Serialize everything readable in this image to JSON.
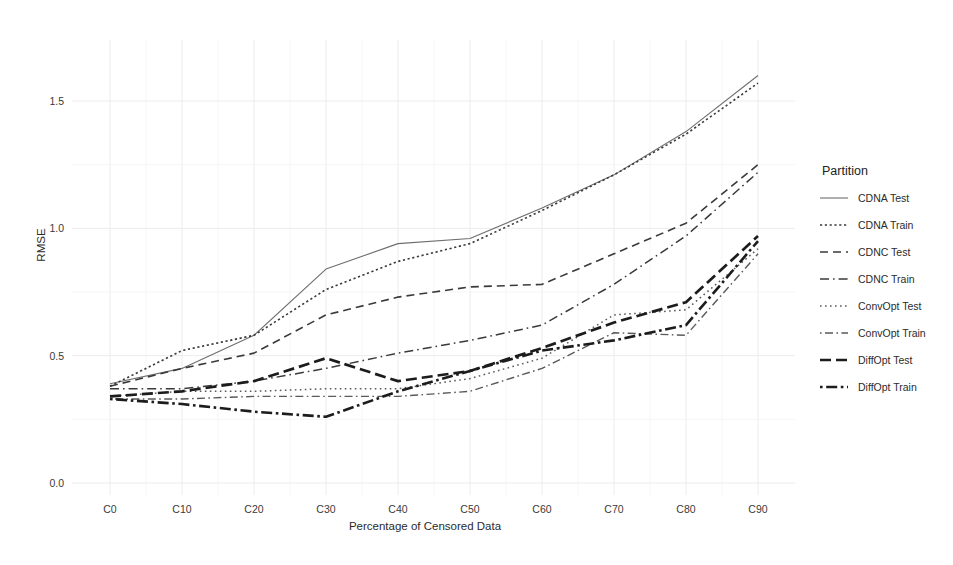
{
  "chart_data": {
    "type": "line",
    "title": "",
    "xlabel": "Percentage of Censored Data",
    "ylabel": "RMSE",
    "categories": [
      "C0",
      "C10",
      "C20",
      "C30",
      "C40",
      "C50",
      "C60",
      "C70",
      "C80",
      "C90"
    ],
    "x_tick_labels": [
      "C0",
      "C10",
      "C20",
      "C30",
      "C40",
      "C50",
      "C60",
      "C70",
      "C80",
      "C90"
    ],
    "y_tick_labels": [
      "0.0",
      "0.5",
      "1.0",
      "1.5"
    ],
    "y_ticks": [
      0.0,
      0.5,
      1.0,
      1.5
    ],
    "ylim": [
      -0.07,
      1.72
    ],
    "grid": true,
    "grid_minor": true,
    "legend_position": "right",
    "legend_title": "Partition",
    "series": [
      {
        "name": "CDNA Test",
        "style": "solid",
        "color": "#6e6e6e",
        "width": 1.1,
        "values": [
          0.39,
          0.45,
          0.58,
          0.84,
          0.94,
          0.96,
          1.08,
          1.21,
          1.38,
          1.6
        ]
      },
      {
        "name": "CDNA Train",
        "style": "dotted",
        "color": "#3a3a3a",
        "width": 1.6,
        "values": [
          0.38,
          0.52,
          0.58,
          0.76,
          0.87,
          0.94,
          1.07,
          1.21,
          1.37,
          1.57
        ]
      },
      {
        "name": "CDNC Test",
        "style": "dashed",
        "color": "#3a3a3a",
        "width": 1.6,
        "values": [
          0.38,
          0.45,
          0.51,
          0.66,
          0.73,
          0.77,
          0.78,
          0.9,
          1.02,
          1.25
        ]
      },
      {
        "name": "CDNC Train",
        "style": "dashdot",
        "color": "#3a3a3a",
        "width": 1.5,
        "values": [
          0.37,
          0.37,
          0.4,
          0.45,
          0.51,
          0.56,
          0.62,
          0.78,
          0.97,
          1.22
        ]
      },
      {
        "name": "ConvOpt Test",
        "style": "finedot",
        "color": "#5a5a5a",
        "width": 1.5,
        "values": [
          0.34,
          0.36,
          0.36,
          0.37,
          0.37,
          0.41,
          0.49,
          0.66,
          0.68,
          0.92
        ]
      },
      {
        "name": "ConvOpt Train",
        "style": "dotdash",
        "color": "#5a5a5a",
        "width": 1.4,
        "values": [
          0.33,
          0.33,
          0.34,
          0.34,
          0.34,
          0.36,
          0.45,
          0.59,
          0.58,
          0.9
        ]
      },
      {
        "name": "DiffOpt Test",
        "style": "thick-dash",
        "color": "#1c1c1c",
        "width": 2.7,
        "values": [
          0.34,
          0.36,
          0.4,
          0.49,
          0.4,
          0.44,
          0.53,
          0.63,
          0.71,
          0.97
        ]
      },
      {
        "name": "DiffOpt Train",
        "style": "thick-dotdash",
        "color": "#1c1c1c",
        "width": 2.6,
        "values": [
          0.33,
          0.31,
          0.28,
          0.26,
          0.36,
          0.44,
          0.52,
          0.56,
          0.62,
          0.95
        ]
      }
    ]
  },
  "legend": {
    "title": "Partition",
    "entries": [
      {
        "label": "CDNA Test"
      },
      {
        "label": "CDNA Train"
      },
      {
        "label": "CDNC Test"
      },
      {
        "label": "CDNC Train"
      },
      {
        "label": "ConvOpt Test"
      },
      {
        "label": "ConvOpt Train"
      },
      {
        "label": "DiffOpt Test"
      },
      {
        "label": "DiffOpt Train"
      }
    ]
  },
  "colors": {
    "background": "#ffffff",
    "grid_major": "#ececec",
    "grid_minor": "#f5f5f5",
    "text": "#2b2b2b"
  }
}
